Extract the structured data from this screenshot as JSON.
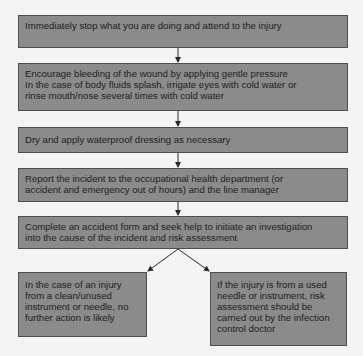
{
  "diagram": {
    "type": "flowchart",
    "steps": [
      {
        "id": "step-1",
        "text": "Immediately stop what you are doing and attend to the injury"
      },
      {
        "id": "step-2",
        "text": "Encourage bleeding of the wound by applying gentle pressure\nIn the case of body fluids splash, irrigate eyes with cold water or\nrinse mouth/nose several times with cold water"
      },
      {
        "id": "step-3",
        "text": "Dry and apply waterproof dressing as necessary"
      },
      {
        "id": "step-4",
        "text": "Report the incident to the occupational health department (or\naccident and emergency out of hours) and the line manager"
      },
      {
        "id": "step-5",
        "text": "Complete an accident form and seek help to initiate an investigation\ninto the cause of the incident and risk assessment"
      }
    ],
    "branches": [
      {
        "id": "branch-clean",
        "text": "In the case of an injury\nfrom a clean/unused\ninstrument or needle, no\nfurther action is likely"
      },
      {
        "id": "branch-used",
        "text": "If the injury is from a used\nneedle or instrument, risk\nassessment should be\ncarried out by the infection\ncontrol doctor"
      }
    ],
    "connections": [
      [
        "step-1",
        "step-2"
      ],
      [
        "step-2",
        "step-3"
      ],
      [
        "step-3",
        "step-4"
      ],
      [
        "step-4",
        "step-5"
      ],
      [
        "step-5",
        "branch-clean"
      ],
      [
        "step-5",
        "branch-used"
      ]
    ],
    "colors": {
      "box_fill": "#8b8b8b",
      "box_border": "#4e4e4e",
      "text": "#1e1e1e",
      "arrow": "#2a2a2a",
      "background": "#f4f4f4"
    }
  }
}
